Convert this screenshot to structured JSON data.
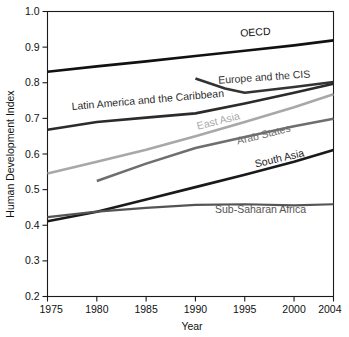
{
  "chart_data": {
    "type": "line",
    "title": "",
    "xlabel": "Year",
    "ylabel": "Human Development Index",
    "xlim": [
      1975,
      2004
    ],
    "ylim": [
      0.2,
      1.0
    ],
    "grid": false,
    "legend_position": "inline-labels",
    "x_ticks": [
      "1975",
      "1980",
      "1985",
      "1990",
      "1995",
      "2000",
      "2004"
    ],
    "x_tick_values": [
      1975,
      1980,
      1985,
      1990,
      1995,
      2000,
      2004
    ],
    "y_ticks": [
      "0.2",
      "0.3",
      "0.4",
      "0.5",
      "0.6",
      "0.7",
      "0.8",
      "0.9",
      "1.0"
    ],
    "y_tick_values": [
      0.2,
      0.3,
      0.4,
      0.5,
      0.6,
      0.7,
      0.8,
      0.9,
      1.0
    ],
    "series": [
      {
        "name": "OECD",
        "color": "#111111",
        "width": 2.6,
        "label": "OECD",
        "label_x": 1996.1,
        "label_y": 0.932,
        "label_rotate": -4,
        "label_anchor": "middle",
        "x": [
          1975,
          1980,
          1985,
          1990,
          1995,
          2000,
          2004
        ],
        "y": [
          0.831,
          0.846,
          0.86,
          0.875,
          0.89,
          0.905,
          0.919
        ]
      },
      {
        "name": "Europe and the CIS",
        "color": "#333333",
        "width": 2.6,
        "label": "Europe and the CIS",
        "label_x": 1997.0,
        "label_y": 0.806,
        "label_rotate": -4,
        "label_anchor": "middle",
        "x": [
          1990,
          1993,
          1995,
          2000,
          2004
        ],
        "y": [
          0.812,
          0.784,
          0.772,
          0.788,
          0.802
        ]
      },
      {
        "name": "Latin America and the Caribbean",
        "color": "#2b2b2b",
        "width": 2.6,
        "label": "Latin America and the Caribbean",
        "label_x": 1985.2,
        "label_y": 0.742,
        "label_rotate": -5,
        "label_anchor": "middle",
        "x": [
          1975,
          1980,
          1985,
          1990,
          1995,
          2000,
          2004
        ],
        "y": [
          0.668,
          0.69,
          0.702,
          0.714,
          0.742,
          0.772,
          0.797
        ]
      },
      {
        "name": "East Asia",
        "color": "#a8a8a8",
        "width": 2.6,
        "label": "East Asia",
        "label_x": 1992.4,
        "label_y": 0.683,
        "label_rotate": -14,
        "label_anchor": "middle",
        "x": [
          1975,
          1980,
          1985,
          1990,
          1995,
          2000,
          2004
        ],
        "y": [
          0.545,
          0.578,
          0.612,
          0.65,
          0.69,
          0.731,
          0.768
        ]
      },
      {
        "name": "Arab States",
        "color": "#6e6e6e",
        "width": 2.6,
        "label": "Arab States",
        "label_x": 1997.0,
        "label_y": 0.645,
        "label_rotate": -14,
        "label_anchor": "middle",
        "x": [
          1980,
          1985,
          1990,
          1995,
          2000,
          2004
        ],
        "y": [
          0.524,
          0.573,
          0.617,
          0.648,
          0.678,
          0.699
        ]
      },
      {
        "name": "South Asia",
        "color": "#1a1a1a",
        "width": 2.6,
        "label": "South Asia",
        "label_x": 1998.6,
        "label_y": 0.578,
        "label_rotate": -13,
        "label_anchor": "middle",
        "x": [
          1975,
          1980,
          1985,
          1990,
          1995,
          2000,
          2004
        ],
        "y": [
          0.411,
          0.438,
          0.472,
          0.507,
          0.542,
          0.578,
          0.611
        ]
      },
      {
        "name": "Sub-Saharan Africa",
        "color": "#545454",
        "width": 2.2,
        "label": "Sub-Saharan Africa",
        "label_x": 1996.6,
        "label_y": 0.433,
        "label_rotate": 0,
        "label_anchor": "middle",
        "x": [
          1975,
          1980,
          1985,
          1990,
          1995,
          2000,
          2004
        ],
        "y": [
          0.423,
          0.438,
          0.449,
          0.457,
          0.459,
          0.456,
          0.459
        ]
      }
    ]
  }
}
